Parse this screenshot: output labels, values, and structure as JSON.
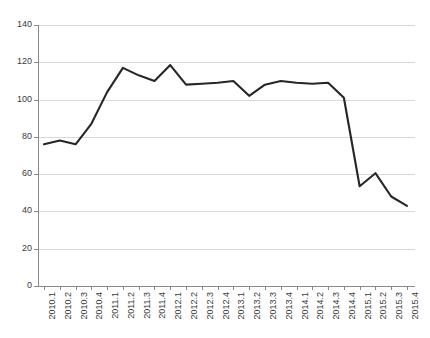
{
  "chart_data": {
    "type": "line",
    "title": "",
    "subtitle": "",
    "xlabel": "",
    "ylabel": "",
    "grid": true,
    "legend": false,
    "legend_position": "none",
    "line_color": "#262626",
    "grid_color": "#d9d9d9",
    "axis_color": "#8a8a8a",
    "ylim": [
      0,
      140
    ],
    "yticks": [
      0,
      20,
      40,
      60,
      80,
      100,
      120,
      140
    ],
    "ytick_labels": [
      "0",
      "20",
      "40",
      "60",
      "80",
      "100",
      "120",
      "140"
    ],
    "categories": [
      "2010.1",
      "2010.2",
      "2010.3",
      "2010.4",
      "2011.1",
      "2011.2",
      "2011.3",
      "2011.4",
      "2012.1",
      "2012.2",
      "2012.3",
      "2012.4",
      "2013.1",
      "2013.2",
      "2013.3",
      "2013.4",
      "2014.1",
      "2014.2",
      "2014.3",
      "2014.4",
      "2015.1",
      "2015.2",
      "2015.3",
      "2015.4"
    ],
    "series": [
      {
        "name": "series-1",
        "values": [
          76,
          78,
          76,
          87,
          104,
          117,
          113,
          110,
          118.5,
          108,
          108.5,
          109,
          110,
          102,
          108,
          110,
          109,
          108.5,
          109,
          101,
          53.5,
          60.5,
          48,
          43
        ]
      }
    ]
  }
}
